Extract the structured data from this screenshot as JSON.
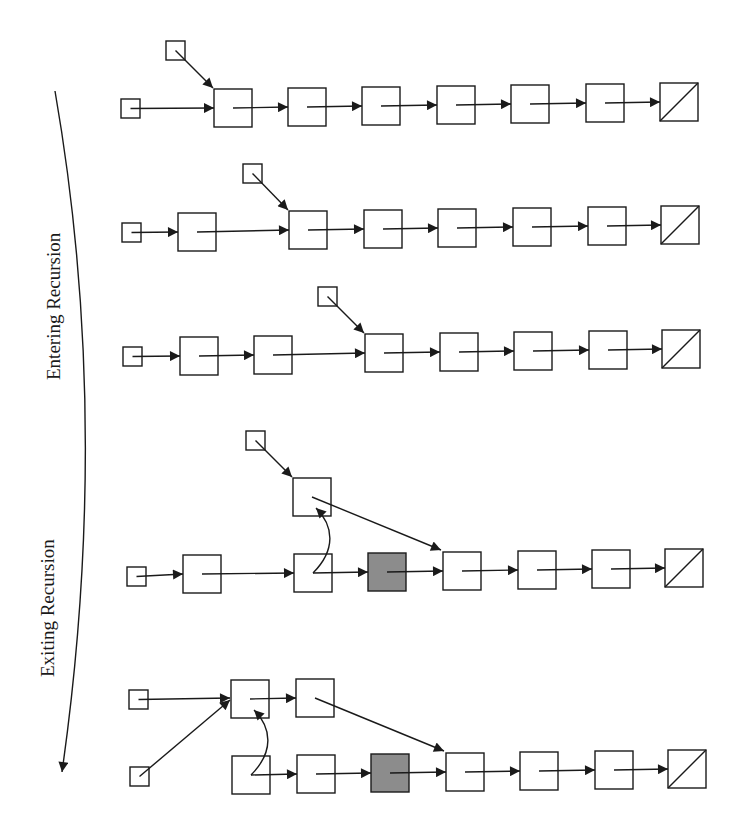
{
  "figure": {
    "labels": {
      "entering": "Entering Recursion",
      "exiting": "Exiting Recursion"
    },
    "colors": {
      "stroke": "#1a1a1a",
      "node_fill": "#ffffff",
      "shaded_fill": "#8c8c8c",
      "background": "#ffffff"
    },
    "stages": [
      {
        "phase": "entering",
        "head": {
          "x": 121,
          "y": 99,
          "size": 19
        },
        "pointer": {
          "x": 166,
          "y": 41,
          "size": 19,
          "target": 0
        },
        "nodes": [
          {
            "x": 214,
            "y": 89,
            "type": "normal"
          },
          {
            "x": 288,
            "y": 88,
            "type": "normal"
          },
          {
            "x": 362,
            "y": 87,
            "type": "normal"
          },
          {
            "x": 437,
            "y": 86,
            "type": "normal"
          },
          {
            "x": 511,
            "y": 85,
            "type": "normal"
          },
          {
            "x": 586,
            "y": 84,
            "type": "normal"
          },
          {
            "x": 660,
            "y": 83,
            "type": "null"
          }
        ],
        "head_target": 0
      },
      {
        "phase": "entering",
        "head": {
          "x": 122,
          "y": 223,
          "size": 19
        },
        "pointer": {
          "x": 243,
          "y": 164,
          "size": 19,
          "target": 1
        },
        "nodes": [
          {
            "x": 178,
            "y": 213,
            "type": "normal"
          },
          {
            "x": 289,
            "y": 211,
            "type": "normal"
          },
          {
            "x": 364,
            "y": 210,
            "type": "normal"
          },
          {
            "x": 438,
            "y": 209,
            "type": "normal"
          },
          {
            "x": 513,
            "y": 208,
            "type": "normal"
          },
          {
            "x": 588,
            "y": 207,
            "type": "normal"
          },
          {
            "x": 661,
            "y": 206,
            "type": "null"
          }
        ],
        "head_target": 0
      },
      {
        "phase": "entering",
        "head": {
          "x": 123,
          "y": 347,
          "size": 19
        },
        "pointer": {
          "x": 318,
          "y": 287,
          "size": 19,
          "target": 2
        },
        "nodes": [
          {
            "x": 180,
            "y": 337,
            "type": "normal"
          },
          {
            "x": 254,
            "y": 336,
            "type": "normal"
          },
          {
            "x": 365,
            "y": 334,
            "type": "normal"
          },
          {
            "x": 440,
            "y": 333,
            "type": "normal"
          },
          {
            "x": 514,
            "y": 332,
            "type": "normal"
          },
          {
            "x": 589,
            "y": 331,
            "type": "normal"
          },
          {
            "x": 662,
            "y": 330,
            "type": "null"
          }
        ],
        "head_target": 0
      },
      {
        "phase": "exiting",
        "head": {
          "x": 127,
          "y": 567,
          "size": 19
        },
        "pointer": {
          "x": 246,
          "y": 431,
          "size": 19,
          "target": "lifted"
        },
        "lifted": {
          "x": 293,
          "y": 478
        },
        "nodes": [
          {
            "x": 183,
            "y": 555,
            "type": "normal"
          },
          {
            "x": 294,
            "y": 554,
            "type": "normal"
          },
          {
            "x": 368,
            "y": 553,
            "type": "shaded"
          },
          {
            "x": 443,
            "y": 552,
            "type": "normal"
          },
          {
            "x": 518,
            "y": 551,
            "type": "normal"
          },
          {
            "x": 592,
            "y": 550,
            "type": "normal"
          },
          {
            "x": 665,
            "y": 549,
            "type": "null"
          }
        ],
        "head_target": 0
      },
      {
        "phase": "exiting",
        "head_top": {
          "x": 129,
          "y": 690,
          "size": 19
        },
        "head_bottom": {
          "x": 130,
          "y": 767,
          "size": 19
        },
        "top_nodes": [
          {
            "x": 231,
            "y": 680,
            "type": "normal"
          },
          {
            "x": 296,
            "y": 679,
            "type": "normal"
          }
        ],
        "nodes": [
          {
            "x": 232,
            "y": 756,
            "type": "normal"
          },
          {
            "x": 297,
            "y": 755,
            "type": "normal"
          },
          {
            "x": 371,
            "y": 754,
            "type": "shaded"
          },
          {
            "x": 446,
            "y": 753,
            "type": "normal"
          },
          {
            "x": 520,
            "y": 752,
            "type": "normal"
          },
          {
            "x": 595,
            "y": 751,
            "type": "normal"
          },
          {
            "x": 668,
            "y": 750,
            "type": "null"
          }
        ]
      }
    ],
    "node_size": 38
  }
}
